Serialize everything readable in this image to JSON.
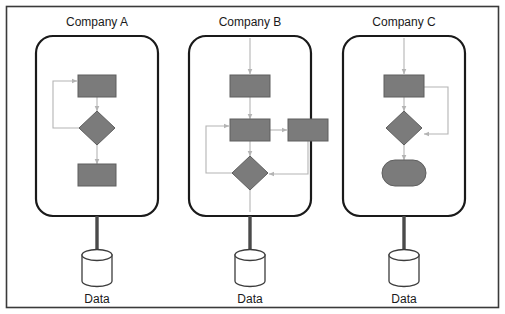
{
  "figure": {
    "frame": {
      "stroke": "#3a3a3a",
      "fill": "#ffffff"
    },
    "palette": {
      "node_fill": "#7b7b7b",
      "node_stroke": "#5e5e5e",
      "connector": "#b4b4b4",
      "thick_link": "#4a4a4a",
      "panel_stroke": "#1a1a1a",
      "store_fill": "#ffffff",
      "store_stroke": "#3c3c3c",
      "text": "#1a1a1a"
    },
    "panels": [
      {
        "id": "company-a",
        "title": "Company A",
        "store_label": "Data",
        "has_top_entry_arrow": false,
        "nodes": [
          {
            "name": "process-top",
            "shape": "rectangle"
          },
          {
            "name": "decision",
            "shape": "diamond"
          },
          {
            "name": "process-bottom",
            "shape": "rectangle"
          }
        ],
        "connectors": [
          {
            "name": "top-to-decision",
            "kind": "straight"
          },
          {
            "name": "decision-to-bottom",
            "kind": "straight"
          },
          {
            "name": "feedback-loop-left",
            "kind": "loop-left"
          }
        ]
      },
      {
        "id": "company-b",
        "title": "Company B",
        "store_label": "Data",
        "has_top_entry_arrow": true,
        "nodes": [
          {
            "name": "process-top",
            "shape": "rectangle"
          },
          {
            "name": "process-middle",
            "shape": "rectangle"
          },
          {
            "name": "process-right",
            "shape": "rectangle"
          },
          {
            "name": "decision",
            "shape": "diamond"
          }
        ],
        "connectors": [
          {
            "name": "top-to-middle",
            "kind": "straight"
          },
          {
            "name": "middle-to-right",
            "kind": "straight"
          },
          {
            "name": "middle-to-decision",
            "kind": "straight"
          },
          {
            "name": "feedback-loop-left",
            "kind": "loop-left"
          },
          {
            "name": "right-to-decision",
            "kind": "loop-right"
          },
          {
            "name": "decision-exit-down",
            "kind": "straight"
          }
        ]
      },
      {
        "id": "company-c",
        "title": "Company C",
        "store_label": "Data",
        "has_top_entry_arrow": true,
        "nodes": [
          {
            "name": "process-top",
            "shape": "rectangle"
          },
          {
            "name": "decision",
            "shape": "diamond"
          },
          {
            "name": "terminator",
            "shape": "stadium"
          }
        ],
        "connectors": [
          {
            "name": "top-to-decision",
            "kind": "straight"
          },
          {
            "name": "decision-to-terminator",
            "kind": "straight"
          },
          {
            "name": "feedback-loop-right",
            "kind": "loop-right"
          }
        ]
      }
    ]
  }
}
